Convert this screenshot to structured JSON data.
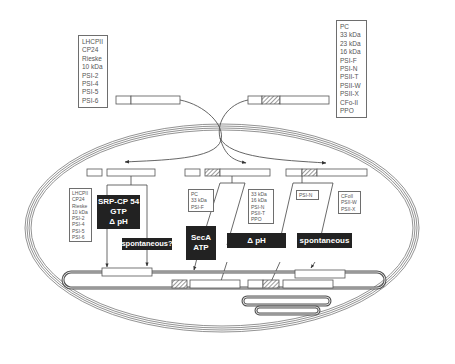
{
  "figure": {
    "colors": {
      "line": "#555555",
      "box_fill": "#ffffff",
      "label_fill": "#222222",
      "label_text": "#ffffff",
      "hatch": "#666666",
      "background": "#ffffff"
    }
  },
  "top_left_list": {
    "items": [
      "LHCPII",
      "CP24",
      "Rieske",
      "10 kDa",
      "PSI-2",
      "PSI-4",
      "PSI-5",
      "PSI-6"
    ]
  },
  "top_right_list": {
    "items": [
      "PC",
      "33 kDa",
      "23 kDa",
      "16 kDa",
      "PSI-F",
      "PSI-N",
      "PSII-T",
      "PSII-W",
      "PSII-X",
      "CFo-II",
      "PPO"
    ]
  },
  "pathways": [
    {
      "id": "srp",
      "label_lines": [
        "SRP-CP 54",
        "GTP",
        "Δ pH"
      ],
      "secondary_label": "spontaneous?",
      "proteins": [
        "LHCPII",
        "CP24",
        "Rieske",
        "10 kDa",
        "PSI-2",
        "PSI-4",
        "PSI-5",
        "PSI-6"
      ]
    },
    {
      "id": "sec",
      "label_lines": [
        "SecA",
        "ATP"
      ],
      "proteins": [
        "PC",
        "33 kDa",
        "PSI-F"
      ]
    },
    {
      "id": "delta-ph",
      "label_lines": [
        "Δ pH"
      ],
      "proteins": [
        "33 kDa",
        "16 kDa",
        "PSI-N",
        "PSII-T",
        "PPO"
      ]
    },
    {
      "id": "spontaneous",
      "label_lines": [
        "spontaneous"
      ],
      "proteins_a": [
        "PSI-N"
      ],
      "proteins_b": [
        "CFoII",
        "PSII-W",
        "PSII-X"
      ]
    }
  ]
}
